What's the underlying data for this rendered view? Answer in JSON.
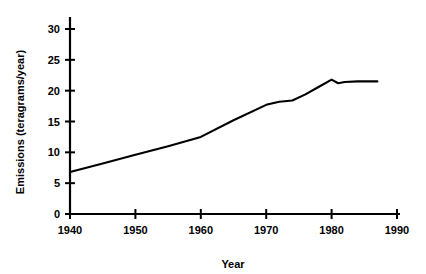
{
  "chart_data": {
    "type": "line",
    "title": "",
    "xlabel": "Year",
    "ylabel": "Emissions (teragrams/year)",
    "xlim": [
      1940,
      1990
    ],
    "ylim": [
      0,
      32
    ],
    "xticks": [
      1940,
      1950,
      1960,
      1970,
      1980,
      1990
    ],
    "yticks": [
      0,
      5,
      10,
      15,
      20,
      25,
      30
    ],
    "xtick_labels": [
      "1940",
      "1950",
      "1960",
      "1970",
      "1980",
      "1990"
    ],
    "ytick_labels": [
      "0",
      "5",
      "10",
      "15",
      "20",
      "25",
      "30"
    ],
    "grid": false,
    "legend": null,
    "series": [
      {
        "name": "Emissions",
        "color": "#000000",
        "x": [
          1940,
          1945,
          1950,
          1955,
          1960,
          1965,
          1970,
          1972,
          1974,
          1976,
          1978,
          1980,
          1981,
          1982,
          1984,
          1987
        ],
        "values": [
          6.8,
          8.2,
          9.6,
          11.0,
          12.5,
          15.2,
          17.7,
          18.2,
          18.4,
          19.4,
          20.6,
          21.8,
          21.2,
          21.4,
          21.5,
          21.5
        ]
      }
    ]
  },
  "axes": {
    "ylabel": "Emissions (teragrams/year)",
    "xlabel": "Year"
  }
}
